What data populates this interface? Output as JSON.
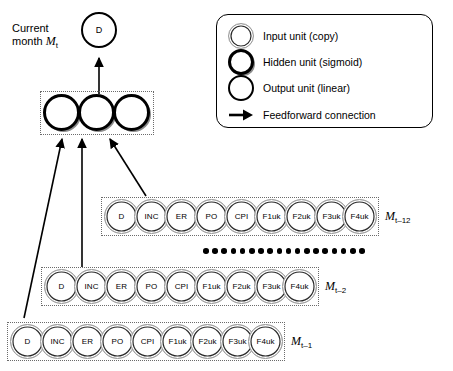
{
  "figure": {
    "type": "neural-network-architecture-diagram",
    "current_month_label_line1": "Current",
    "current_month_label_line2": "month",
    "current_month_symbol": "M",
    "current_month_subscript": "t"
  },
  "output_layer": {
    "unit_label": "D",
    "unit_type": "output"
  },
  "hidden_layer": {
    "unit_count": 3,
    "unit_type": "hidden",
    "units": [
      "",
      "",
      ""
    ]
  },
  "input_rows": [
    {
      "name": "row-t-12",
      "tag_symbol": "M",
      "tag_subscript": "t–12",
      "units": [
        "D",
        "INC",
        "ER",
        "PO",
        "CPI",
        "F1uk",
        "F2uk",
        "F3uk",
        "F4uk"
      ]
    },
    {
      "name": "row-t-2",
      "tag_symbol": "M",
      "tag_subscript": "t–2",
      "units": [
        "D",
        "INC",
        "ER",
        "PO",
        "CPI",
        "F1uk",
        "F2uk",
        "F3uk",
        "F4uk"
      ]
    },
    {
      "name": "row-t-1",
      "tag_symbol": "M",
      "tag_subscript": "t–1",
      "units": [
        "D",
        "INC",
        "ER",
        "PO",
        "CPI",
        "F1uk",
        "F2uk",
        "F3uk",
        "F4uk"
      ]
    }
  ],
  "ellipsis": {
    "dot_count": 18
  },
  "legend": {
    "items": [
      {
        "swatch": "input",
        "label": "Input unit (copy)"
      },
      {
        "swatch": "hidden",
        "label": "Hidden unit (sigmoid)"
      },
      {
        "swatch": "output",
        "label": "Output unit (linear)"
      },
      {
        "swatch": "arrow",
        "label": "Feedforward connection"
      }
    ]
  },
  "colors": {
    "ink": "#000000",
    "group_box_border": "#6b6b6b",
    "input_ring_outer": "#9a9a9a",
    "hidden_shadow": "#8c8c8c",
    "background": "#ffffff"
  }
}
